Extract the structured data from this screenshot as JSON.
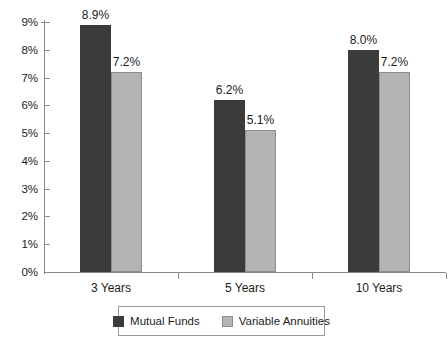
{
  "chart_data": {
    "type": "bar",
    "title": "",
    "subtitle": "",
    "xlabel": "",
    "ylabel": "",
    "categories": [
      "3 Years",
      "5 Years",
      "10 Years"
    ],
    "series": [
      {
        "name": "Mutual Funds",
        "color": "#3b3b3b",
        "values": [
          8.9,
          6.2,
          8.0
        ],
        "labels": [
          "8.9%",
          "6.2%",
          "8.0%"
        ]
      },
      {
        "name": "Variable Annuities",
        "color": "#b3b3b3",
        "values": [
          7.2,
          5.1,
          7.2
        ],
        "labels": [
          "7.2%",
          "5.1%",
          "7.2%"
        ]
      }
    ],
    "ylim": [
      0,
      9
    ],
    "ytick_values": [
      9,
      8,
      7,
      6,
      5,
      4,
      3,
      2,
      1,
      0
    ],
    "ytick_labels": [
      "9%",
      "8%",
      "7%",
      "6%",
      "5%",
      "4%",
      "3%",
      "2%",
      "1%",
      "0%"
    ],
    "grid": false,
    "legend_position": "bottom",
    "value_labels_shown": true
  },
  "legend": {
    "items": [
      {
        "label": "Mutual Funds",
        "swatch": "dark-swatch"
      },
      {
        "label": "Variable Annuities",
        "swatch": "light-swatch"
      }
    ]
  }
}
